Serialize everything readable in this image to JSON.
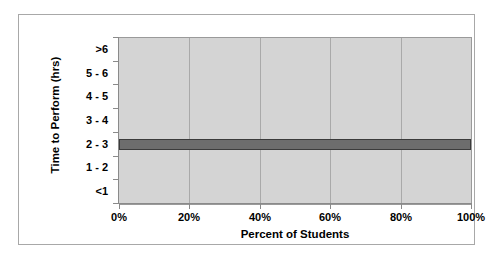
{
  "chart_data": {
    "type": "bar",
    "orientation": "horizontal",
    "title": "",
    "xlabel": "Percent of Students",
    "ylabel": "Time to Perform (hrs)",
    "categories": [
      ">6",
      "5 - 6",
      "4 - 5",
      "3 - 4",
      "2 - 3",
      "1 - 2",
      "<1"
    ],
    "values": [
      0,
      0,
      0,
      0,
      100,
      0,
      0
    ],
    "xlim": [
      0,
      100
    ],
    "xticks": [
      0,
      20,
      40,
      60,
      80,
      100
    ],
    "xtick_labels": [
      "0%",
      "20%",
      "40%",
      "60%",
      "80%",
      "100%"
    ],
    "grid": "vertical",
    "legend": "none",
    "colors": {
      "plot_background": "#d4d4d4",
      "bar_fill": "#6d6d6d",
      "bar_outline": "#3b3b3b",
      "gridline": "#a9a9a9",
      "axis": "#8a8a8a",
      "frame": "#a8a8a8",
      "text": "#000000",
      "figure_background": "#ffffff"
    }
  }
}
